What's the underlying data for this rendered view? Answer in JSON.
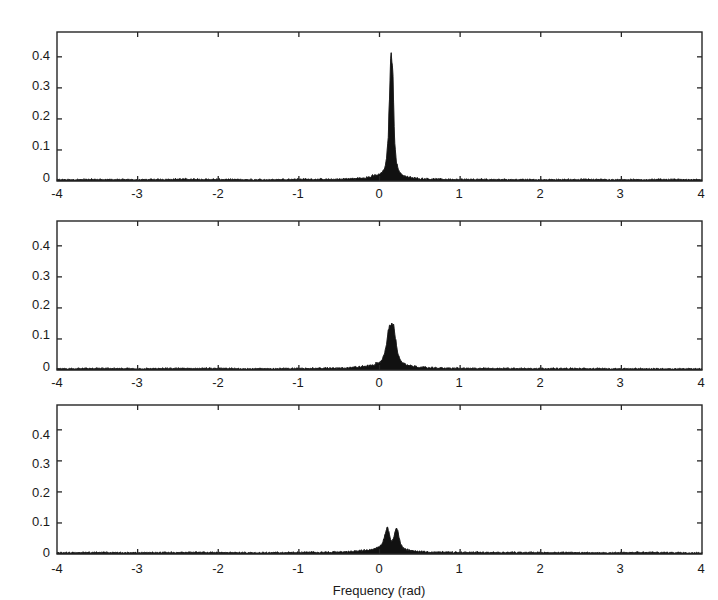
{
  "figure": {
    "title": "",
    "panel_count": 3,
    "background_color": "#ffffff",
    "line_color": "#111111"
  },
  "axes": {
    "xlabel": "Frequency (rad)",
    "ylabel": "",
    "xlim": [
      -4,
      4
    ],
    "ylim": [
      0,
      0.48
    ],
    "xticks": [
      -4,
      -3,
      -2,
      -1,
      0,
      1,
      2,
      3,
      4
    ],
    "xticklabels": [
      "-4",
      "-3",
      "-2",
      "-1",
      "0",
      "1",
      "2",
      "3",
      "4"
    ],
    "yticks": [
      0,
      0.1,
      0.2,
      0.3,
      0.4
    ],
    "yticklabels": [
      "0",
      "0.1",
      "0.2",
      "0.3",
      "0.4"
    ],
    "grid": false,
    "tick_direction": "in"
  },
  "chart_data": {
    "type": "line",
    "title": "",
    "xlabel": "Frequency (rad)",
    "ylabel": "",
    "xlim": [
      -4,
      4
    ],
    "ylim": [
      0,
      0.48
    ],
    "xticks": [
      -4,
      -3,
      -2,
      -1,
      0,
      1,
      2,
      3,
      4
    ],
    "yticks": [
      0,
      0.1,
      0.2,
      0.3,
      0.4
    ],
    "grid": false,
    "legend": "none",
    "panels": [
      {
        "index": 1,
        "name": "panel-top",
        "description": "Single sharp narrow spectral peak near 0.15 rad",
        "peak_count": 1,
        "peaks": [
          {
            "x": 0.15,
            "y": 0.41,
            "halfwidth": 0.035
          }
        ],
        "noise_floor": 0.006,
        "series": [
          {
            "name": "spectrum",
            "x": [
              -4.0,
              -3.5,
              -3.0,
              -2.5,
              -2.0,
              -1.5,
              -1.0,
              -0.6,
              -0.4,
              -0.3,
              -0.2,
              -0.12,
              -0.05,
              0.0,
              0.04,
              0.07,
              0.09,
              0.11,
              0.12,
              0.13,
              0.14,
              0.15,
              0.16,
              0.17,
              0.18,
              0.19,
              0.21,
              0.24,
              0.28,
              0.33,
              0.4,
              0.5,
              0.7,
              1.0,
              1.5,
              2.0,
              2.5,
              3.0,
              3.5,
              4.0
            ],
            "values": [
              0.004,
              0.005,
              0.004,
              0.006,
              0.005,
              0.004,
              0.006,
              0.005,
              0.007,
              0.008,
              0.01,
              0.013,
              0.018,
              0.022,
              0.03,
              0.045,
              0.075,
              0.15,
              0.24,
              0.33,
              0.39,
              0.41,
              0.38,
              0.3,
              0.2,
              0.12,
              0.06,
              0.032,
              0.02,
              0.014,
              0.01,
              0.008,
              0.006,
              0.005,
              0.005,
              0.004,
              0.005,
              0.004,
              0.005,
              0.004
            ]
          }
        ]
      },
      {
        "index": 2,
        "name": "panel-middle",
        "description": "Broader, lower spectral peak near 0.15 rad with ragged top",
        "peak_count": 1,
        "peaks": [
          {
            "x": 0.15,
            "y": 0.15,
            "halfwidth": 0.055
          }
        ],
        "noise_floor": 0.006,
        "series": [
          {
            "name": "spectrum",
            "x": [
              -4.0,
              -3.5,
              -3.0,
              -2.5,
              -2.0,
              -1.5,
              -1.0,
              -0.6,
              -0.4,
              -0.3,
              -0.2,
              -0.12,
              -0.05,
              0.0,
              0.03,
              0.05,
              0.07,
              0.09,
              0.1,
              0.11,
              0.12,
              0.13,
              0.14,
              0.15,
              0.16,
              0.17,
              0.18,
              0.19,
              0.2,
              0.22,
              0.25,
              0.29,
              0.34,
              0.42,
              0.55,
              0.8,
              1.2,
              2.0,
              3.0,
              4.0
            ],
            "values": [
              0.004,
              0.005,
              0.004,
              0.005,
              0.005,
              0.004,
              0.005,
              0.006,
              0.007,
              0.009,
              0.011,
              0.014,
              0.019,
              0.024,
              0.032,
              0.045,
              0.062,
              0.085,
              0.105,
              0.125,
              0.138,
              0.148,
              0.141,
              0.15,
              0.143,
              0.147,
              0.138,
              0.12,
              0.098,
              0.062,
              0.036,
              0.022,
              0.015,
              0.011,
              0.008,
              0.006,
              0.005,
              0.005,
              0.004,
              0.004
            ]
          }
        ]
      },
      {
        "index": 3,
        "name": "panel-bottom",
        "description": "Two resolved spectral peaks near 0.10 and 0.21 rad",
        "peak_count": 2,
        "peaks": [
          {
            "x": 0.1,
            "y": 0.085,
            "halfwidth": 0.03
          },
          {
            "x": 0.21,
            "y": 0.088,
            "halfwidth": 0.03
          }
        ],
        "noise_floor": 0.006,
        "series": [
          {
            "name": "spectrum",
            "x": [
              -4.0,
              -3.5,
              -3.0,
              -2.5,
              -2.0,
              -1.5,
              -1.0,
              -0.6,
              -0.4,
              -0.3,
              -0.2,
              -0.12,
              -0.05,
              0.0,
              0.03,
              0.05,
              0.07,
              0.085,
              0.1,
              0.115,
              0.13,
              0.145,
              0.16,
              0.175,
              0.19,
              0.205,
              0.215,
              0.23,
              0.245,
              0.26,
              0.29,
              0.33,
              0.4,
              0.5,
              0.7,
              1.0,
              1.8,
              2.6,
              3.4,
              4.0
            ],
            "values": [
              0.004,
              0.005,
              0.004,
              0.005,
              0.005,
              0.004,
              0.005,
              0.006,
              0.007,
              0.009,
              0.011,
              0.014,
              0.019,
              0.024,
              0.032,
              0.045,
              0.066,
              0.08,
              0.085,
              0.074,
              0.055,
              0.044,
              0.042,
              0.05,
              0.07,
              0.086,
              0.088,
              0.072,
              0.05,
              0.034,
              0.02,
              0.014,
              0.01,
              0.008,
              0.006,
              0.005,
              0.005,
              0.004,
              0.005,
              0.004
            ]
          }
        ]
      }
    ]
  }
}
